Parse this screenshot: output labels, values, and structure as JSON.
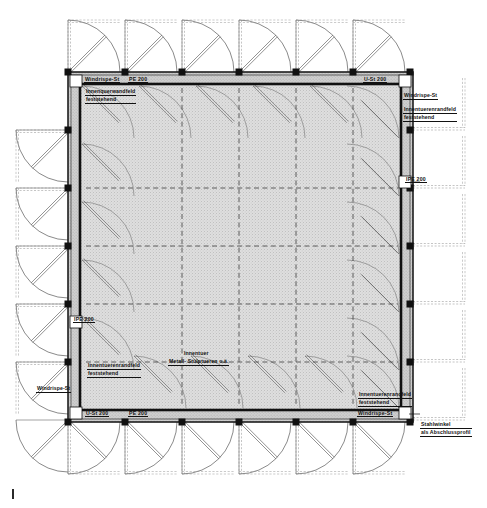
{
  "drawing": {
    "type": "architectural-floor-plan",
    "title": "Hallen-Grundriss",
    "language": "de",
    "sheet_mark": "|"
  },
  "colors": {
    "line": "#1a1a1a",
    "thin_line": "#555555",
    "hatch_fill": "#d9d9d9",
    "band_fill": "#cfcfcf",
    "paper": "#ffffff",
    "dashed": "#3a3a3a"
  },
  "geometry": {
    "outer_frame": {
      "x": 68,
      "y": 72,
      "w": 345,
      "h": 350
    },
    "inner_wall": {
      "x": 80,
      "y": 84,
      "w": 321,
      "h": 326
    },
    "bays_horizontal": 6,
    "bays_vertical": 6,
    "column_xs": [
      68,
      125,
      182,
      239,
      296,
      353,
      410
    ],
    "column_ys": [
      72,
      130,
      188,
      246,
      304,
      362,
      420
    ],
    "grid_dash_xs": [
      182,
      239,
      296,
      353
    ],
    "grid_dash_ys": [
      188,
      246,
      304,
      362
    ],
    "door_arc_radius": 52,
    "door_leaf_thickness": 3
  },
  "labels": {
    "top_left_band_1": "Windrispe-St",
    "top_left_band_2": "PE 200",
    "top_right_band": "U-St 200",
    "top_left_note": [
      "Innenquerwandfeld",
      "feststehend"
    ],
    "right_top_note_1": "Windrispe-St",
    "right_top_note_2": [
      "Innentuerenrandfeld",
      "feststehend"
    ],
    "right_mid": "IPE 200",
    "left_mid": "IPE 200",
    "left_low_note": [
      "Innentuerenrandfeld",
      "feststehend"
    ],
    "left_low_windrispe": "Windrispe-St",
    "bottom_left_band_1": "U-St 200",
    "bottom_left_band_2": "PE 200",
    "bottom_right_note": [
      "Innentuerenrandfeld",
      "feststehend"
    ],
    "bottom_right_band": "Windrispe-St",
    "bottom_right_corner": [
      "Stahlwinkel",
      "als Abschlussprofil"
    ],
    "center_note_1": "Innentuer",
    "center_note_2": "Metall- Stülptueren o.ä."
  },
  "legend_terms": {
    "windrispe": "Windrispe-St",
    "u_profile": "U-St 200",
    "pe_profile": "PE 200",
    "ipe_profile": "IPE 200",
    "steel_angle": "Stahlwinkel als Abschlussprofil",
    "fixed_panel": "feststehend"
  }
}
